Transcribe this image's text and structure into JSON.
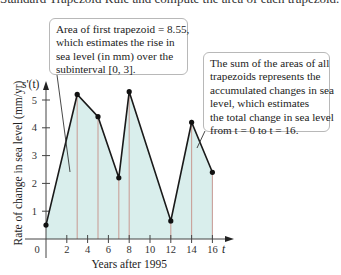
{
  "header": {
    "cut_off_text": "Standard Trapezoid Rule and compute the area of each trapezoid."
  },
  "callouts": {
    "first_trapezoid": {
      "lines": [
        "Area of first trapezoid = 8.55,",
        "which estimates the rise in",
        "sea level (in mm) over the",
        "subinterval [0, 3]."
      ]
    },
    "sum_of_areas": {
      "lines": [
        "The sum of the areas of all",
        "trapezoids represents the",
        "accumulated changes in sea",
        "level, which estimates",
        "the total change in sea level",
        "from t = 0 to t = 16."
      ]
    }
  },
  "colors": {
    "fill": "#d9eeec",
    "line": "#1a1a1a",
    "vertical": "#c9a09a",
    "axis": "#444444"
  },
  "chart_data": {
    "type": "area",
    "title": "",
    "xlabel": "Years after 1995",
    "ylabel": "Rate of change in sea level (mm/yr)",
    "y_axis_name": "s'(t)",
    "x_axis_name": "t",
    "x": [
      0,
      3,
      5,
      7,
      8,
      12,
      14,
      16
    ],
    "values": [
      0.5,
      5.2,
      4.4,
      2.2,
      5.3,
      0.65,
      4.2,
      2.4
    ],
    "x_ticks": [
      0,
      2,
      4,
      6,
      8,
      10,
      12,
      14,
      16
    ],
    "y_ticks": [
      1,
      2,
      3,
      4,
      5
    ],
    "xlim": [
      0,
      16
    ],
    "ylim": [
      0,
      5.5
    ],
    "grid": false,
    "annotations": [
      "Area of first trapezoid = 8.55, which estimates the rise in sea level (in mm) over the subinterval [0, 3].",
      "The sum of the areas of all trapezoids represents the accumulated changes in sea level, which estimates the total change in sea level from t = 0 to t = 16."
    ]
  }
}
